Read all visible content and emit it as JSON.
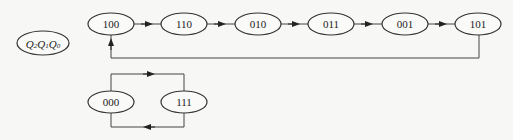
{
  "diagram": {
    "type": "state-transition",
    "legend": {
      "label": "Q₂Q₁Q₀",
      "parts": [
        "Q",
        "2",
        "Q",
        "1",
        "Q",
        "0"
      ]
    },
    "main_cycle": {
      "states": [
        "100",
        "110",
        "010",
        "011",
        "001",
        "101"
      ],
      "transitions": [
        [
          "100",
          "110"
        ],
        [
          "110",
          "010"
        ],
        [
          "010",
          "011"
        ],
        [
          "011",
          "001"
        ],
        [
          "001",
          "101"
        ],
        [
          "101",
          "100"
        ]
      ]
    },
    "secondary_cycle": {
      "states": [
        "000",
        "111"
      ],
      "transitions": [
        [
          "000",
          "111"
        ],
        [
          "111",
          "000"
        ]
      ]
    }
  }
}
